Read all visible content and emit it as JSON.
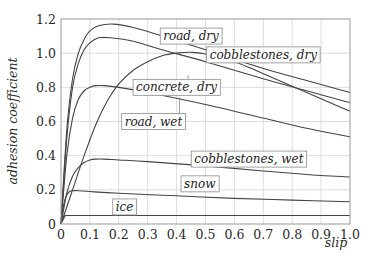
{
  "chart_data": {
    "type": "line",
    "title": "",
    "xlabel": "slip",
    "ylabel": "adhesion coefficient",
    "xlim": [
      0,
      1.0
    ],
    "ylim": [
      0,
      1.2
    ],
    "grid": true,
    "legend_position": "inline labels",
    "x_ticks": [
      "0",
      "0.1",
      "0.2",
      "0.3",
      "0.4",
      "0.5",
      "0.6",
      "0.7",
      "0.8",
      "0.9",
      "1.0"
    ],
    "y_ticks": [
      "0",
      "0.2",
      "0.4",
      "0.6",
      "0.8",
      "1.0",
      "1.2"
    ],
    "series": [
      {
        "name": "road, dry",
        "x": [
          0,
          0.02,
          0.04,
          0.06,
          0.08,
          0.1,
          0.13,
          0.18,
          0.25,
          0.35,
          0.5,
          0.7,
          0.85,
          1.0
        ],
        "values": [
          0,
          0.55,
          0.85,
          1.0,
          1.08,
          1.13,
          1.16,
          1.17,
          1.15,
          1.1,
          1.02,
          0.91,
          0.84,
          0.77
        ],
        "label_pos": [
          0.45,
          1.1
        ],
        "label_anchor": [
          0.37,
          1.08
        ]
      },
      {
        "name": "cobblestones, dry",
        "x": [
          0,
          0.02,
          0.04,
          0.06,
          0.08,
          0.1,
          0.13,
          0.17,
          0.25,
          0.35,
          0.5,
          0.7,
          0.85,
          1.0
        ],
        "values": [
          0,
          0.5,
          0.8,
          0.94,
          1.02,
          1.06,
          1.09,
          1.09,
          1.07,
          1.02,
          0.95,
          0.85,
          0.78,
          0.71
        ],
        "label_pos": [
          0.7,
          0.99
        ],
        "label_anchor": [
          0.6,
          0.94
        ]
      },
      {
        "name": "concrete, dry",
        "x": [
          0,
          0.04,
          0.08,
          0.12,
          0.16,
          0.2,
          0.25,
          0.3,
          0.35,
          0.4,
          0.45,
          0.5,
          0.6,
          0.7,
          0.85,
          1.0
        ],
        "values": [
          0,
          0.2,
          0.4,
          0.58,
          0.72,
          0.82,
          0.9,
          0.95,
          0.985,
          1.0,
          1.005,
          0.995,
          0.95,
          0.88,
          0.77,
          0.66
        ],
        "label_pos": [
          0.4,
          0.8
        ],
        "label_anchor": [
          0.44,
          0.87
        ]
      },
      {
        "name": "road, wet",
        "x": [
          0,
          0.02,
          0.04,
          0.06,
          0.08,
          0.1,
          0.12,
          0.15,
          0.2,
          0.3,
          0.5,
          0.7,
          0.85,
          1.0
        ],
        "values": [
          0,
          0.4,
          0.62,
          0.73,
          0.78,
          0.8,
          0.81,
          0.81,
          0.8,
          0.77,
          0.7,
          0.62,
          0.56,
          0.51
        ],
        "label_pos": [
          0.32,
          0.6
        ],
        "label_anchor": [
          0.41,
          0.74
        ]
      },
      {
        "name": "cobblestones, wet",
        "x": [
          0,
          0.02,
          0.04,
          0.06,
          0.08,
          0.1,
          0.12,
          0.15,
          0.2,
          0.3,
          0.5,
          0.7,
          0.85,
          1.0
        ],
        "values": [
          0,
          0.18,
          0.28,
          0.33,
          0.36,
          0.375,
          0.38,
          0.38,
          0.375,
          0.365,
          0.34,
          0.31,
          0.29,
          0.275
        ],
        "label_pos": [
          0.65,
          0.38
        ],
        "label_anchor": [
          0.6,
          0.34
        ]
      },
      {
        "name": "snow",
        "x": [
          0,
          0.01,
          0.02,
          0.03,
          0.04,
          0.06,
          0.1,
          0.2,
          0.4,
          0.6,
          0.8,
          1.0
        ],
        "values": [
          0,
          0.12,
          0.17,
          0.19,
          0.195,
          0.195,
          0.19,
          0.18,
          0.165,
          0.15,
          0.14,
          0.13
        ],
        "label_pos": [
          0.48,
          0.235
        ],
        "label_anchor": [
          0.45,
          0.185
        ]
      },
      {
        "name": "ice",
        "x": [
          0,
          0.01,
          0.015,
          0.02,
          0.1,
          0.4,
          0.7,
          1.0
        ],
        "values": [
          0,
          0.035,
          0.048,
          0.05,
          0.05,
          0.05,
          0.05,
          0.05
        ],
        "label_pos": [
          0.22,
          0.1
        ],
        "label_anchor": [
          0.22,
          0.05
        ]
      }
    ]
  }
}
